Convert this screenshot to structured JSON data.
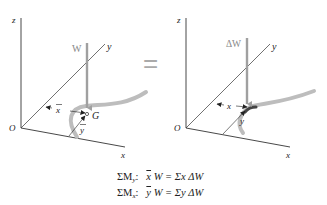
{
  "figure": {
    "left_panel": {
      "axes": {
        "z": "z",
        "y": "y",
        "x": "x",
        "origin": "O"
      },
      "force_label": "W",
      "centroid_label": "G",
      "xbar_label": "x",
      "ybar_label": "y"
    },
    "equals_sign": "=",
    "right_panel": {
      "axes": {
        "z": "z",
        "y": "y",
        "x": "x",
        "origin": "O"
      },
      "force_label": "ΔW",
      "x_label": "x",
      "y_label": "y"
    },
    "colors": {
      "axis": "#333333",
      "arrow": "#a0a0a0",
      "rod": "#bdbdbd",
      "text_gray": "#888888"
    }
  },
  "equations": [
    {
      "lhs_sigma": "ΣM",
      "lhs_sub": "y",
      "colon": ":",
      "bar_var": "x",
      "rhs": "W = Σx ΔW"
    },
    {
      "lhs_sigma": "ΣM",
      "lhs_sub": "x",
      "colon": ":",
      "bar_var": "y",
      "rhs": "W = Σy ΔW"
    }
  ]
}
